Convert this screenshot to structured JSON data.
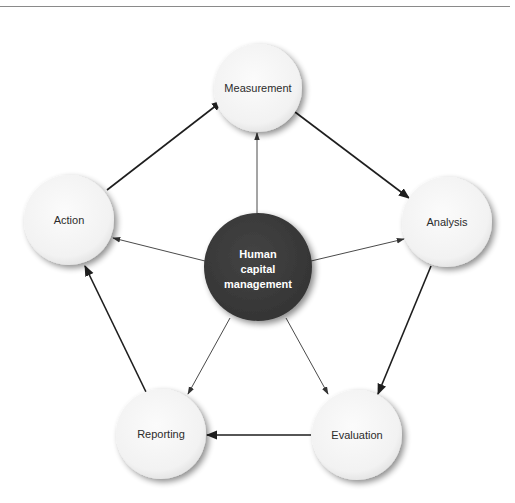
{
  "diagram": {
    "type": "cycle-with-hub",
    "center": {
      "label_lines": [
        "Human",
        "capital",
        "management"
      ],
      "fill": "#3a3a3a",
      "text_color": "#ffffff"
    },
    "nodes": [
      {
        "id": "measurement",
        "label": "Measurement"
      },
      {
        "id": "analysis",
        "label": "Analysis"
      },
      {
        "id": "evaluation",
        "label": "Evaluation"
      },
      {
        "id": "reporting",
        "label": "Reporting"
      },
      {
        "id": "action",
        "label": "Action"
      }
    ],
    "cycle_edges": [
      {
        "from": "measurement",
        "to": "analysis"
      },
      {
        "from": "analysis",
        "to": "evaluation"
      },
      {
        "from": "evaluation",
        "to": "reporting"
      },
      {
        "from": "reporting",
        "to": "action"
      },
      {
        "from": "action",
        "to": "measurement"
      }
    ],
    "hub_edges": [
      {
        "from": "center",
        "to": "measurement"
      },
      {
        "from": "center",
        "to": "analysis"
      },
      {
        "from": "center",
        "to": "evaluation"
      },
      {
        "from": "center",
        "to": "reporting"
      },
      {
        "from": "center",
        "to": "action"
      }
    ],
    "colors": {
      "node_fill": "#f4f4f4",
      "arrow": "#1e1e1e",
      "hub_arrow": "#4a4a4a",
      "rule": "#8a8a8a"
    }
  }
}
